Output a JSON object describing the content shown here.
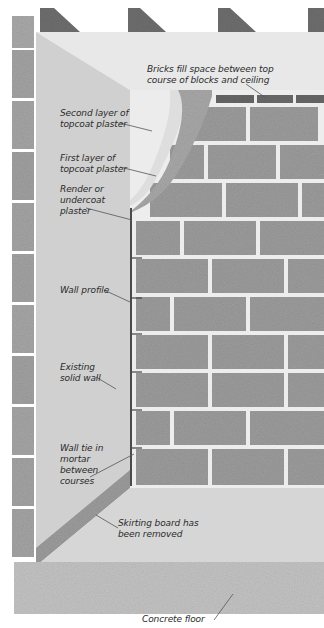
{
  "diagram": {
    "colors": {
      "background": "#ffffff",
      "joist": "#6e6e6e",
      "joist_shadow": "#4a4a4a",
      "ceiling": "#e6e6e6",
      "side_wall": "#cfcfcf",
      "left_blocks": "#a3a3a3",
      "blocks": "#9b9b9b",
      "top_bricks": "#6a6a6a",
      "mortar": "#ededed",
      "render_plaster": "#a9a9a9",
      "topcoat_plaster": "#dedede",
      "floor_screed": "#d0d0d0",
      "concrete_floor": "#c2c2c2",
      "skirting_strip": "#9e9e9e",
      "label_text": "#2b2b2b",
      "leader_line": "#555555"
    },
    "labels": [
      {
        "id": "bricks-fill",
        "text": "Bricks fill space between top\ncourse of blocks and ceiling"
      },
      {
        "id": "second-topcoat",
        "text": "Second layer of\ntopcoat plaster"
      },
      {
        "id": "first-topcoat",
        "text": "First layer of\ntopcoat plaster"
      },
      {
        "id": "render-undercoat",
        "text": "Render or\nundercoat\nplaster"
      },
      {
        "id": "wall-profile",
        "text": "Wall profile"
      },
      {
        "id": "existing-wall",
        "text": "Existing\nsolid wall"
      },
      {
        "id": "wall-tie",
        "text": "Wall tie in\nmortar\nbetween\ncourses"
      },
      {
        "id": "skirting-removed",
        "text": "Skirting board has\nbeen removed"
      },
      {
        "id": "concrete-floor",
        "text": "Concrete floor"
      }
    ]
  }
}
